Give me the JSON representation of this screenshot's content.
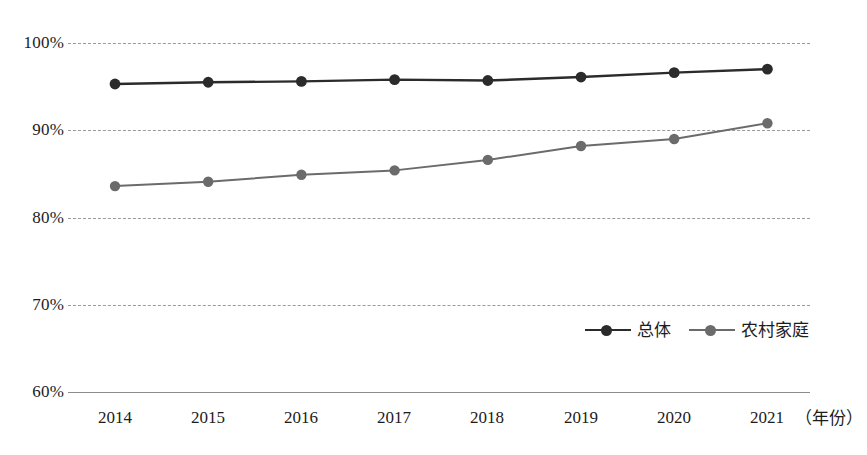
{
  "chart_data": {
    "type": "line",
    "title": "",
    "xlabel": "年份",
    "ylabel": "",
    "x": [
      "2014",
      "2015",
      "2016",
      "2017",
      "2018",
      "2019",
      "2020",
      "2021"
    ],
    "categories": [
      "2014",
      "2015",
      "2016",
      "2017",
      "2018",
      "2019",
      "2020",
      "2021"
    ],
    "ylim": [
      60,
      100
    ],
    "yticks": [
      100,
      90,
      80,
      70,
      60
    ],
    "ytick_labels": [
      "100%",
      "90%",
      "80%",
      "70%",
      "60%"
    ],
    "grid": true,
    "grid_style": "dashed-horizontal",
    "legend_position": "inside-bottom-right",
    "series": [
      {
        "name": "总体",
        "color": "#2b2b2b",
        "marker": "circle",
        "values": [
          95.3,
          95.5,
          95.6,
          95.8,
          95.7,
          96.1,
          96.6,
          97.0
        ]
      },
      {
        "name": "农村家庭",
        "color": "#6b6b6b",
        "marker": "circle",
        "values": [
          83.6,
          84.1,
          84.9,
          85.4,
          86.6,
          88.2,
          89.0,
          90.8
        ]
      }
    ]
  },
  "axis": {
    "y_ticks": [
      "100%",
      "90%",
      "80%",
      "70%",
      "60%"
    ],
    "x_ticks": [
      "2014",
      "2015",
      "2016",
      "2017",
      "2018",
      "2019",
      "2020",
      "2021"
    ],
    "x_unit": "（年份）"
  },
  "legend": {
    "items": [
      {
        "label": "总体",
        "color": "#2b2b2b"
      },
      {
        "label": "农村家庭",
        "color": "#6b6b6b"
      }
    ]
  },
  "colors": {
    "series_overall": "#2b2b2b",
    "series_rural": "#6b6b6b",
    "gridline": "#9a9a9a",
    "baseline": "#8c8c8c",
    "text": "#1c1c1c",
    "background": "#ffffff"
  }
}
